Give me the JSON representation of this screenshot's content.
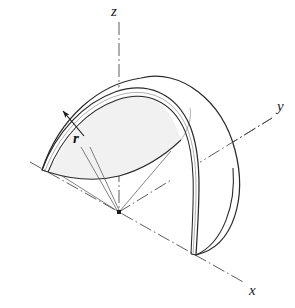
{
  "figure": {
    "background_color": "#ffffff",
    "line_color": "#2b2b2b",
    "axis_color": "#4a4a4a",
    "shade_color": "#f1f1f1",
    "inner_shade_color": "#fbfbfb"
  },
  "axes": [
    {
      "id": "z",
      "label": "z",
      "style": "dash-dot",
      "direction": "vertical-up",
      "origin": {
        "x": 119,
        "y": 212
      },
      "tip": {
        "x": 119,
        "y": 22
      },
      "label_pos": {
        "x": 117,
        "y": 12
      }
    },
    {
      "id": "y",
      "label": "y",
      "style": "dash-dot",
      "direction": "up-right",
      "origin": {
        "x": 119,
        "y": 212
      },
      "tip": {
        "x": 272,
        "y": 118
      },
      "label_pos": {
        "x": 283,
        "y": 108
      }
    },
    {
      "id": "x",
      "label": "x",
      "style": "dash-dot",
      "direction": "down-right",
      "origin": {
        "x": 119,
        "y": 212
      },
      "tip": {
        "x": 245,
        "y": 283
      },
      "back_tip": {
        "x": 30,
        "y": 162
      },
      "label_pos": {
        "x": 255,
        "y": 292
      }
    }
  ],
  "dimensions": [
    {
      "id": "r",
      "label": "r",
      "kind": "radius",
      "arrow": "single-arrowhead pointing up-left to inner dome surface",
      "label_pos": {
        "x": 79,
        "y": 140
      },
      "arrow_tip": {
        "x": 62,
        "y": 110
      },
      "leaders_to_origin": 2
    }
  ],
  "solid": {
    "name": "hemispherical shell",
    "cut": "half section",
    "radius_px": 93,
    "wall_thickness_px": 6,
    "center": {
      "x": 119,
      "y": 212
    }
  },
  "labels_visible": [
    "z",
    "y",
    "x",
    "r"
  ]
}
